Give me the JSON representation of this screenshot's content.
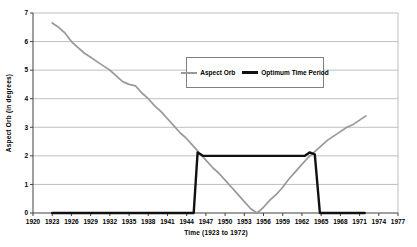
{
  "chart_data": {
    "type": "line",
    "title": "",
    "xlabel": "Time (1923 to 1972)",
    "ylabel": "Aspect Orb (in degrees)",
    "xlim": [
      1920,
      1977
    ],
    "ylim": [
      0,
      7
    ],
    "x_ticks": [
      1920,
      1923,
      1926,
      1929,
      1932,
      1935,
      1938,
      1941,
      1944,
      1947,
      1950,
      1953,
      1956,
      1959,
      1962,
      1965,
      1968,
      1971,
      1974,
      1977
    ],
    "y_ticks": [
      0,
      1,
      2,
      3,
      4,
      5,
      6,
      7
    ],
    "grid": "horizontal-y",
    "legend_position": "inside-top-center",
    "series": [
      {
        "name": "Aspect Orb",
        "color": "#999999",
        "stroke_width": 1.7,
        "swatch_height": 2,
        "points": [
          [
            1923,
            6.65
          ],
          [
            1924,
            6.5
          ],
          [
            1925,
            6.3
          ],
          [
            1926,
            6.0
          ],
          [
            1927,
            5.8
          ],
          [
            1928,
            5.6
          ],
          [
            1929,
            5.45
          ],
          [
            1930,
            5.3
          ],
          [
            1931,
            5.15
          ],
          [
            1932,
            5.0
          ],
          [
            1933,
            4.8
          ],
          [
            1934,
            4.6
          ],
          [
            1935,
            4.5
          ],
          [
            1936,
            4.45
          ],
          [
            1937,
            4.2
          ],
          [
            1938,
            4.0
          ],
          [
            1939,
            3.75
          ],
          [
            1940,
            3.55
          ],
          [
            1941,
            3.3
          ],
          [
            1942,
            3.05
          ],
          [
            1943,
            2.8
          ],
          [
            1944,
            2.6
          ],
          [
            1945,
            2.35
          ],
          [
            1946,
            2.1
          ],
          [
            1947,
            1.85
          ],
          [
            1948,
            1.6
          ],
          [
            1949,
            1.4
          ],
          [
            1950,
            1.15
          ],
          [
            1951,
            0.9
          ],
          [
            1952,
            0.65
          ],
          [
            1953,
            0.4
          ],
          [
            1954,
            0.15
          ],
          [
            1955,
            0.0
          ],
          [
            1956,
            0.2
          ],
          [
            1957,
            0.45
          ],
          [
            1958,
            0.65
          ],
          [
            1959,
            0.9
          ],
          [
            1960,
            1.2
          ],
          [
            1961,
            1.45
          ],
          [
            1962,
            1.7
          ],
          [
            1963,
            1.95
          ],
          [
            1964,
            2.15
          ],
          [
            1965,
            2.35
          ],
          [
            1966,
            2.55
          ],
          [
            1967,
            2.7
          ],
          [
            1968,
            2.85
          ],
          [
            1969,
            3.0
          ],
          [
            1970,
            3.1
          ],
          [
            1971,
            3.25
          ],
          [
            1972,
            3.4
          ]
        ]
      },
      {
        "name": "Optimum Time Period",
        "color": "#111111",
        "stroke_width": 2.4,
        "swatch_height": 3,
        "points": [
          [
            1923,
            0
          ],
          [
            1945.1,
            0
          ],
          [
            1945.7,
            2.12
          ],
          [
            1946.6,
            2.0
          ],
          [
            1962.4,
            2.0
          ],
          [
            1963.2,
            2.12
          ],
          [
            1964.0,
            2.05
          ],
          [
            1964.8,
            0
          ],
          [
            1971.8,
            0
          ]
        ]
      }
    ],
    "layout": {
      "plot_left": 33,
      "plot_top": 13,
      "plot_right": 398,
      "plot_bottom": 213
    }
  },
  "colors": {
    "background": "#ffffff",
    "gridline": "#bfbfbf",
    "axis": "#404040",
    "plot_border_right": "#bfbfbf",
    "legend_border": "#7f7f7f",
    "text": "#000000"
  }
}
